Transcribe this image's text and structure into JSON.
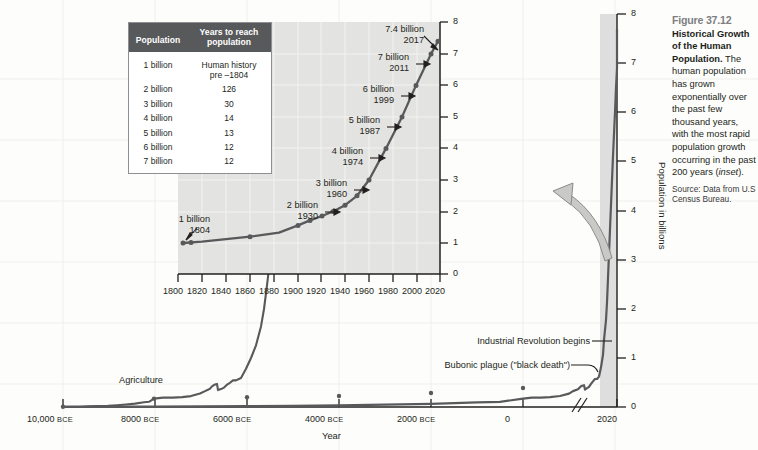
{
  "caption": {
    "figure_number": "Figure 37.12",
    "title": "Historical Growth of the Human Population.",
    "body": " The human population has grown exponentially over the past few thousand years, with the most rapid population growth occurring in the past 200 years (inset).",
    "body_plain": "The human population has grown exponentially over the past few thousand years, with the most rapid population growth occurring in the past 200 years (inset).",
    "italic_word": "inset",
    "source": "Source: Data from U.S Census Bureau."
  },
  "table": {
    "headers": [
      "Population",
      "Years to reach population"
    ],
    "header_col1": "Population",
    "header_col2_line1": "Years to reach",
    "header_col2_line2": "population",
    "rows": [
      {
        "population": "1 billion",
        "years_line1": "Human history",
        "years_line2": "pre –1804"
      },
      {
        "population": "2 billion",
        "years_line1": "126",
        "years_line2": ""
      },
      {
        "population": "3 billion",
        "years_line1": "30",
        "years_line2": ""
      },
      {
        "population": "4 billion",
        "years_line1": "14",
        "years_line2": ""
      },
      {
        "population": "5 billion",
        "years_line1": "13",
        "years_line2": ""
      },
      {
        "population": "6 billion",
        "years_line1": "12",
        "years_line2": ""
      },
      {
        "population": "7 billion",
        "years_line1": "12",
        "years_line2": ""
      }
    ]
  },
  "colors": {
    "line": "#58595b",
    "panel_background": "#e3e3e1",
    "band": "#dedede",
    "grid": "#f0efec",
    "axis": "#231f20",
    "table_header": "#58595b",
    "caption_fignum": "#7d7f82",
    "arrow_fill": "#c9c9c7",
    "arrow_stroke": "#8a8a88"
  },
  "chart_data": [
    {
      "id": "main-chart",
      "type": "line",
      "title": "",
      "xlabel": "Year",
      "ylabel": "Population in billions",
      "xtick_labels": [
        "10,000 BCE",
        "8000 BCE",
        "6000 BCE",
        "4000 BCE",
        "2000 BCE",
        "0",
        "2020"
      ],
      "xtick_values": [
        -10000,
        -8000,
        -6000,
        -4000,
        -2000,
        0,
        2020
      ],
      "ytick_labels": [
        "0",
        "1",
        "2",
        "3",
        "4",
        "5",
        "6",
        "7",
        "8"
      ],
      "ylim": [
        0,
        8
      ],
      "xlim": [
        -10000,
        2020
      ],
      "grid": true,
      "axis_break": true,
      "axis_break_note": "double-slash break on x-axis between 0 and 2020",
      "annotations": [
        {
          "text": "Agriculture",
          "x": -8000,
          "y": 0.3
        },
        {
          "text": "Bubonic plague (\"black death\")",
          "x": 1350,
          "y": 0.45
        },
        {
          "text": "Industrial Revolution begins",
          "x": 1800,
          "y": 1.0
        }
      ],
      "x": [
        -10000,
        -9000,
        -8000,
        -7000,
        -6000,
        -5000,
        -4000,
        -3000,
        -2000,
        -1000,
        -500,
        0,
        200,
        400,
        600,
        800,
        1000,
        1100,
        1200,
        1250,
        1300,
        1340,
        1360,
        1400,
        1450,
        1500,
        1550,
        1600,
        1650,
        1700,
        1750,
        1800,
        1850,
        1900,
        1927,
        1950,
        1960,
        1974,
        1987,
        1999,
        2011,
        2017,
        2020
      ],
      "y": [
        0.004,
        0.005,
        0.005,
        0.007,
        0.01,
        0.015,
        0.025,
        0.04,
        0.06,
        0.09,
        0.1,
        0.17,
        0.19,
        0.19,
        0.2,
        0.22,
        0.27,
        0.32,
        0.36,
        0.4,
        0.43,
        0.44,
        0.35,
        0.37,
        0.4,
        0.46,
        0.5,
        0.55,
        0.55,
        0.6,
        0.79,
        1.0,
        1.26,
        1.65,
        2.0,
        2.5,
        3.0,
        4.0,
        5.0,
        6.0,
        7.0,
        7.4,
        7.7
      ]
    },
    {
      "id": "inset-chart",
      "type": "line",
      "title": "",
      "xlabel": "",
      "ylabel": "",
      "xtick_labels": [
        "1800",
        "1820",
        "1840",
        "1860",
        "1880",
        "1900",
        "1920",
        "1940",
        "1960",
        "1980",
        "2000",
        "2020"
      ],
      "ytick_labels": [
        "0",
        "1",
        "2",
        "3",
        "4",
        "5",
        "6",
        "7",
        "8"
      ],
      "ylim": [
        0,
        8
      ],
      "xlim": [
        1800,
        2020
      ],
      "grid": true,
      "annotations": [
        {
          "label_line1": "1 billion",
          "label_line2": "1804",
          "year": 1804,
          "value": 1.0
        },
        {
          "label_line1": "2 billion",
          "label_line2": "1930",
          "year": 1930,
          "value": 2.0
        },
        {
          "label_line1": "3 billion",
          "label_line2": "1960",
          "year": 1960,
          "value": 3.0
        },
        {
          "label_line1": "4 billion",
          "label_line2": "1974",
          "year": 1974,
          "value": 4.0
        },
        {
          "label_line1": "5 billion",
          "label_line2": "1987",
          "year": 1987,
          "value": 5.0
        },
        {
          "label_line1": "6 billion",
          "label_line2": "1999",
          "year": 1999,
          "value": 6.0
        },
        {
          "label_line1": "7 billion",
          "label_line2": "2011",
          "year": 2011,
          "value": 7.0
        },
        {
          "label_line1": "7.4 billion",
          "label_line2": "2017",
          "year": 2017,
          "value": 7.4
        }
      ],
      "x": [
        1804,
        1820,
        1840,
        1860,
        1880,
        1900,
        1910,
        1920,
        1930,
        1940,
        1950,
        1960,
        1974,
        1987,
        1999,
        2011,
        2017
      ],
      "y": [
        1.0,
        1.04,
        1.12,
        1.2,
        1.33,
        1.56,
        1.72,
        1.86,
        2.0,
        2.2,
        2.5,
        3.0,
        4.0,
        5.0,
        6.0,
        7.0,
        7.4
      ]
    }
  ],
  "axis_titles": {
    "main_y": "Population in billions",
    "main_x": "Year"
  }
}
